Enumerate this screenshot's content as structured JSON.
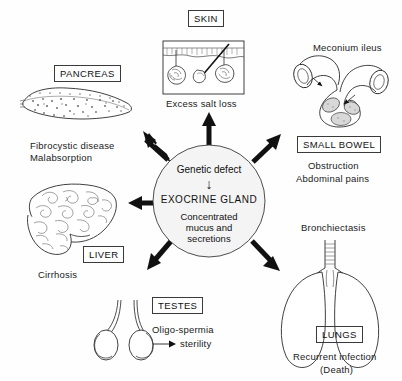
{
  "diagram": {
    "background_color": "#fefefe",
    "ink_color": "#1a1a1a"
  },
  "center": {
    "name": "central-circle",
    "fill_color": "#f4f4f4",
    "line1": "Genetic defect",
    "arrow_glyph": "↓",
    "line2": "EXOCRINE GLAND",
    "line3a": "Concentrated",
    "line3b": "mucus and",
    "line3c": "secretions"
  },
  "organs": {
    "pancreas": {
      "box_label": "PANCREAS",
      "effect_line1": "Fibrocystic disease",
      "effect_line2": "Malabsorption",
      "icon": "pancreas-illustration"
    },
    "skin": {
      "box_label": "SKIN",
      "effect_line1": "Excess salt loss",
      "icon": "skin-cross-section-illustration"
    },
    "small_bowel": {
      "top_label": "Meconium ileus",
      "box_label": "SMALL BOWEL",
      "effect_line1": "Obstruction",
      "effect_line2": "Abdominal pains",
      "icon": "small-bowel-loop-illustration"
    },
    "lungs": {
      "top_label": "Bronchiectasis",
      "box_label": "LUNGS",
      "effect_line1": "Recurrent infection",
      "effect_line2": "(Death)",
      "icon": "lungs-illustration"
    },
    "testes": {
      "box_label": "TESTES",
      "effect_line1": "Oligo-spermia",
      "arrow_glyph": "➤",
      "effect_line2": "sterility",
      "icon": "testes-illustration"
    },
    "liver": {
      "box_label": "LIVER",
      "effect_line1": "Cirrhosis",
      "icon": "liver-cirrhosis-illustration"
    }
  },
  "arrows": [
    {
      "name": "arrow-to-pancreas",
      "direction": "up-left"
    },
    {
      "name": "arrow-to-skin",
      "direction": "up"
    },
    {
      "name": "arrow-to-small-bowel",
      "direction": "up-right"
    },
    {
      "name": "arrow-to-liver",
      "direction": "left"
    },
    {
      "name": "arrow-to-testes",
      "direction": "down-left"
    },
    {
      "name": "arrow-to-lungs",
      "direction": "down-right"
    }
  ]
}
